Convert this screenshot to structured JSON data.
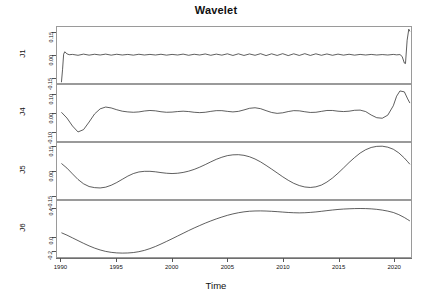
{
  "chart_data": {
    "type": "line",
    "title": "Wavelet",
    "xlabel": "Time",
    "ylabel": "",
    "grid": false,
    "legend": "none",
    "xlim": [
      1989.6,
      2021.6
    ],
    "xticks": [
      1990,
      1995,
      2000,
      2005,
      2010,
      2015,
      2020
    ],
    "xtick_labels": [
      "1990",
      "1995",
      "2000",
      "2005",
      "2010",
      "2015",
      "2020"
    ],
    "layout": "stacked multi-panel wavelet decomposition, 4 shared-x panels",
    "panels": [
      {
        "name": "J1",
        "ylim": [
          -0.19,
          0.19
        ],
        "yticks": [
          0.15,
          0.0,
          -0.15
        ],
        "ytick_labels": [
          "0.15",
          "0.00",
          "-0.15"
        ],
        "description": "High-frequency detail component: near zero with small rapid oscillations; sharp negative spike at series start (1990) and sharp positive spike at series end (2021).",
        "x": [
          1990.0,
          1990.1,
          1990.2,
          1990.3,
          1990.5,
          1990.7,
          1991.0,
          1991.5,
          1992.0,
          1992.5,
          1993.0,
          1993.5,
          1994.0,
          1994.5,
          1995.0,
          1995.5,
          1996.0,
          1996.5,
          1997.0,
          1997.5,
          1998.0,
          1998.5,
          1999.0,
          1999.5,
          2000.0,
          2000.5,
          2001.0,
          2001.5,
          2002.0,
          2002.5,
          2003.0,
          2003.5,
          2004.0,
          2004.5,
          2005.0,
          2005.5,
          2006.0,
          2006.5,
          2007.0,
          2007.5,
          2008.0,
          2008.5,
          2009.0,
          2009.5,
          2010.0,
          2010.5,
          2011.0,
          2011.5,
          2012.0,
          2012.5,
          2013.0,
          2013.5,
          2014.0,
          2014.5,
          2015.0,
          2015.5,
          2016.0,
          2016.5,
          2017.0,
          2017.5,
          2018.0,
          2018.5,
          2019.0,
          2019.5,
          2020.0,
          2020.3,
          2020.6,
          2020.8,
          2021.0,
          2021.1,
          2021.25,
          2021.4,
          2021.5
        ],
        "y": [
          -0.185,
          -0.1,
          0.005,
          0.022,
          0.008,
          0.002,
          0.004,
          -0.002,
          0.006,
          -0.001,
          0.005,
          0.0,
          0.006,
          -0.001,
          0.005,
          0.0,
          0.004,
          -0.001,
          0.005,
          0.0,
          0.004,
          0.0,
          0.005,
          -0.001,
          0.004,
          0.0,
          0.006,
          -0.002,
          0.005,
          0.0,
          0.007,
          -0.002,
          0.006,
          -0.001,
          0.008,
          -0.003,
          0.008,
          -0.003,
          0.007,
          -0.002,
          0.009,
          -0.004,
          0.008,
          -0.003,
          0.009,
          -0.004,
          0.008,
          -0.003,
          0.009,
          -0.003,
          0.008,
          -0.002,
          0.007,
          -0.002,
          0.006,
          -0.001,
          0.005,
          -0.001,
          0.004,
          0.0,
          0.004,
          0.0,
          0.003,
          0.0,
          0.004,
          0.001,
          0.003,
          -0.01,
          -0.055,
          -0.058,
          0.1,
          0.175,
          0.16
        ]
      },
      {
        "name": "J4",
        "ylim": [
          -0.155,
          0.155
        ],
        "yticks": [
          0.1,
          0.0,
          -0.1
        ],
        "ytick_labels": [
          "0.10",
          "0.00",
          "-0.10"
        ],
        "description": "Mid-frequency component: starts near zero, deep trough around 1991.5, rises to peak around 1994, then damped oscillations through 2017, dip around 2018, large peak around 2020.3 then falls.",
        "x": [
          1990.0,
          1990.5,
          1991.0,
          1991.5,
          1992.0,
          1992.5,
          1993.0,
          1993.5,
          1994.0,
          1994.5,
          1995.0,
          1995.5,
          1996.0,
          1996.5,
          1997.0,
          1997.5,
          1998.0,
          1998.5,
          1999.0,
          1999.5,
          2000.0,
          2000.5,
          2001.0,
          2001.5,
          2002.0,
          2002.5,
          2003.0,
          2003.5,
          2004.0,
          2004.5,
          2005.0,
          2005.5,
          2006.0,
          2006.5,
          2007.0,
          2007.5,
          2008.0,
          2008.5,
          2009.0,
          2009.5,
          2010.0,
          2010.5,
          2011.0,
          2011.5,
          2012.0,
          2012.5,
          2013.0,
          2013.5,
          2014.0,
          2014.5,
          2015.0,
          2015.5,
          2016.0,
          2016.5,
          2017.0,
          2017.5,
          2018.0,
          2018.5,
          2019.0,
          2019.5,
          2020.0,
          2020.3,
          2020.6,
          2021.0,
          2021.3,
          2021.5
        ],
        "y": [
          0.004,
          -0.028,
          -0.072,
          -0.105,
          -0.092,
          -0.05,
          -0.005,
          0.023,
          0.033,
          0.028,
          0.018,
          0.01,
          0.006,
          0.004,
          0.006,
          0.011,
          0.014,
          0.012,
          0.007,
          0.004,
          0.005,
          0.008,
          0.01,
          0.008,
          0.004,
          0.002,
          0.004,
          0.009,
          0.013,
          0.013,
          0.009,
          0.006,
          0.009,
          0.017,
          0.026,
          0.029,
          0.024,
          0.013,
          0.003,
          -0.002,
          0.001,
          0.008,
          0.013,
          0.012,
          0.007,
          0.003,
          0.004,
          0.009,
          0.014,
          0.014,
          0.01,
          0.008,
          0.01,
          0.015,
          0.016,
          0.008,
          -0.011,
          -0.026,
          -0.029,
          -0.012,
          0.04,
          0.093,
          0.122,
          0.117,
          0.078,
          0.055
        ]
      },
      {
        "name": "J5",
        "ylim": [
          -0.175,
          0.175
        ],
        "yticks": [
          0.15,
          0.0,
          -0.15
        ],
        "ytick_labels": [
          "0.15",
          "0.00",
          "-0.15"
        ],
        "description": "Lower-frequency component: starts high, trough around 1993.5, rises to plateau around 1997.5, shallow dip around 2000, broad peak around 2006, deep trough around 2012.5, tall peak around 2019, then declines.",
        "x": [
          1990.0,
          1990.5,
          1991.0,
          1991.5,
          1992.0,
          1992.5,
          1993.0,
          1993.5,
          1994.0,
          1994.5,
          1995.0,
          1995.5,
          1996.0,
          1996.5,
          1997.0,
          1997.5,
          1998.0,
          1998.5,
          1999.0,
          1999.5,
          2000.0,
          2000.5,
          2001.0,
          2001.5,
          2002.0,
          2002.5,
          2003.0,
          2003.5,
          2004.0,
          2004.5,
          2005.0,
          2005.5,
          2006.0,
          2006.5,
          2007.0,
          2007.5,
          2008.0,
          2008.5,
          2009.0,
          2009.5,
          2010.0,
          2010.5,
          2011.0,
          2011.5,
          2012.0,
          2012.5,
          2013.0,
          2013.5,
          2014.0,
          2014.5,
          2015.0,
          2015.5,
          2016.0,
          2016.5,
          2017.0,
          2017.5,
          2018.0,
          2018.5,
          2019.0,
          2019.5,
          2020.0,
          2020.5,
          2021.0,
          2021.3,
          2021.5
        ],
        "y": [
          0.047,
          0.018,
          -0.018,
          -0.053,
          -0.08,
          -0.097,
          -0.104,
          -0.106,
          -0.101,
          -0.089,
          -0.072,
          -0.052,
          -0.032,
          -0.016,
          -0.006,
          -0.002,
          -0.002,
          -0.005,
          -0.01,
          -0.014,
          -0.016,
          -0.014,
          -0.009,
          -0.001,
          0.01,
          0.024,
          0.04,
          0.057,
          0.073,
          0.086,
          0.096,
          0.101,
          0.102,
          0.098,
          0.089,
          0.075,
          0.057,
          0.035,
          0.012,
          -0.012,
          -0.036,
          -0.058,
          -0.077,
          -0.091,
          -0.1,
          -0.103,
          -0.099,
          -0.088,
          -0.069,
          -0.044,
          -0.014,
          0.019,
          0.053,
          0.084,
          0.112,
          0.133,
          0.147,
          0.154,
          0.155,
          0.149,
          0.136,
          0.113,
          0.081,
          0.058,
          0.042
        ]
      },
      {
        "name": "J6",
        "ylim": [
          -0.3,
          0.52
        ],
        "yticks": [
          0.4,
          0.0,
          -0.2
        ],
        "ytick_labels": [
          "0.4",
          "0.0",
          "-0.2"
        ],
        "description": "Lowest-frequency / smooth trend component: starts around 0.05, deep trough near -0.24 around 1995.5, rises steadily to a high plateau near 0.40 from about 2005, shallow dip around 2011.5, small rise to about 2017, then declines at the end.",
        "x": [
          1990.0,
          1990.5,
          1991.0,
          1991.5,
          1992.0,
          1992.5,
          1993.0,
          1993.5,
          1994.0,
          1994.5,
          1995.0,
          1995.5,
          1996.0,
          1996.5,
          1997.0,
          1997.5,
          1998.0,
          1998.5,
          1999.0,
          1999.5,
          2000.0,
          2000.5,
          2001.0,
          2001.5,
          2002.0,
          2002.5,
          2003.0,
          2003.5,
          2004.0,
          2004.5,
          2005.0,
          2005.5,
          2006.0,
          2006.5,
          2007.0,
          2007.5,
          2008.0,
          2008.5,
          2009.0,
          2009.5,
          2010.0,
          2010.5,
          2011.0,
          2011.5,
          2012.0,
          2012.5,
          2013.0,
          2013.5,
          2014.0,
          2014.5,
          2015.0,
          2015.5,
          2016.0,
          2016.5,
          2017.0,
          2017.5,
          2018.0,
          2018.5,
          2019.0,
          2019.5,
          2020.0,
          2020.5,
          2021.0,
          2021.3,
          2021.5
        ],
        "y": [
          0.055,
          0.02,
          -0.02,
          -0.06,
          -0.1,
          -0.137,
          -0.17,
          -0.197,
          -0.218,
          -0.232,
          -0.24,
          -0.243,
          -0.241,
          -0.235,
          -0.222,
          -0.203,
          -0.177,
          -0.146,
          -0.11,
          -0.072,
          -0.033,
          0.007,
          0.047,
          0.087,
          0.125,
          0.161,
          0.196,
          0.228,
          0.258,
          0.285,
          0.31,
          0.331,
          0.348,
          0.361,
          0.37,
          0.374,
          0.375,
          0.373,
          0.369,
          0.364,
          0.358,
          0.352,
          0.348,
          0.346,
          0.348,
          0.353,
          0.36,
          0.369,
          0.379,
          0.388,
          0.396,
          0.402,
          0.406,
          0.409,
          0.41,
          0.409,
          0.405,
          0.398,
          0.387,
          0.372,
          0.352,
          0.32,
          0.278,
          0.248,
          0.228
        ]
      }
    ]
  }
}
